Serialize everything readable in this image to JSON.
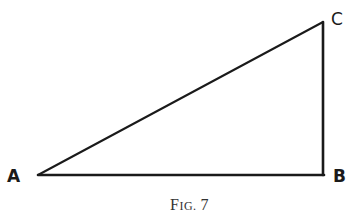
{
  "diagram": {
    "vertices": [
      {
        "id": "A",
        "label": "A"
      },
      {
        "id": "B",
        "label": "B"
      },
      {
        "id": "C",
        "label": "C"
      }
    ],
    "edges": [
      {
        "from": "A",
        "to": "B"
      },
      {
        "from": "B",
        "to": "C"
      },
      {
        "from": "A",
        "to": "C"
      }
    ],
    "right_angle_at": "B",
    "stroke_color": "#1a1a1a"
  },
  "caption": {
    "prefix_big": "F",
    "prefix_small": "IG.",
    "number": "7"
  }
}
